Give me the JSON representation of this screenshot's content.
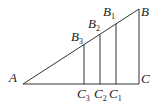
{
  "figure": {
    "type": "geometry",
    "points": {
      "A": {
        "label": "A",
        "x": 23,
        "y": 84
      },
      "B": {
        "label": "B",
        "x": 139,
        "y": 9
      },
      "C": {
        "label": "C",
        "x": 139,
        "y": 84
      },
      "B1": {
        "label": "B",
        "sub": "1",
        "x": 116,
        "y": 24
      },
      "B2": {
        "label": "B",
        "sub": "2",
        "x": 100,
        "y": 34
      },
      "B3": {
        "label": "B",
        "sub": "3",
        "x": 84,
        "y": 45
      },
      "C1": {
        "label": "C",
        "sub": "1",
        "x": 116,
        "y": 84
      },
      "C2": {
        "label": "C",
        "sub": "2",
        "x": 100,
        "y": 84
      },
      "C3": {
        "label": "C",
        "sub": "3",
        "x": 84,
        "y": 84
      }
    },
    "line_color": "#333333"
  }
}
